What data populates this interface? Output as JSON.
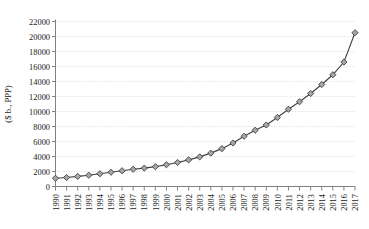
{
  "chart_data": {
    "type": "line",
    "title": "",
    "subtitle": "",
    "xlabel": "",
    "ylabel": "($ b., PPP)",
    "grid": true,
    "legend": false,
    "legend_position": "none",
    "marker": "diamond",
    "marker_fill": "#a6a6a6",
    "marker_edge": "#404040",
    "line_color": "#404040",
    "gridline_color": "#cfcfcf",
    "axis_color": "#808080",
    "xlim": [
      1990,
      2017
    ],
    "ylim": [
      0,
      22000
    ],
    "ytick_step": 2000,
    "ytick_labels": [
      "0",
      "2000",
      "4000",
      "6000",
      "8000",
      "10000",
      "12000",
      "14000",
      "16000",
      "18000",
      "20000",
      "22000"
    ],
    "ytick_values": [
      0,
      2000,
      4000,
      6000,
      8000,
      10000,
      12000,
      14000,
      16000,
      18000,
      20000,
      22000
    ],
    "categories": [
      "1990",
      "1991",
      "1992",
      "1993",
      "1994",
      "1995",
      "1996",
      "1997",
      "1998",
      "1999",
      "2000",
      "2001",
      "2002",
      "2003",
      "2004",
      "2005",
      "2006",
      "2007",
      "2008",
      "2009",
      "2010",
      "2011",
      "2012",
      "2013",
      "2014",
      "2015",
      "2016",
      "2017"
    ],
    "x": [
      1990,
      1991,
      1992,
      1993,
      1994,
      1995,
      1996,
      1997,
      1998,
      1999,
      2000,
      2001,
      2002,
      2003,
      2004,
      2005,
      2006,
      2007,
      2008,
      2009,
      2010,
      2011,
      2012,
      2013,
      2014,
      2015,
      2016,
      2017
    ],
    "values": [
      1100,
      1200,
      1350,
      1500,
      1700,
      1900,
      2100,
      2300,
      2450,
      2650,
      2900,
      3200,
      3550,
      3950,
      4450,
      5050,
      5800,
      6700,
      7500,
      8200,
      9200,
      10300,
      11300,
      12400,
      13600,
      14900,
      16600,
      20500
    ]
  }
}
